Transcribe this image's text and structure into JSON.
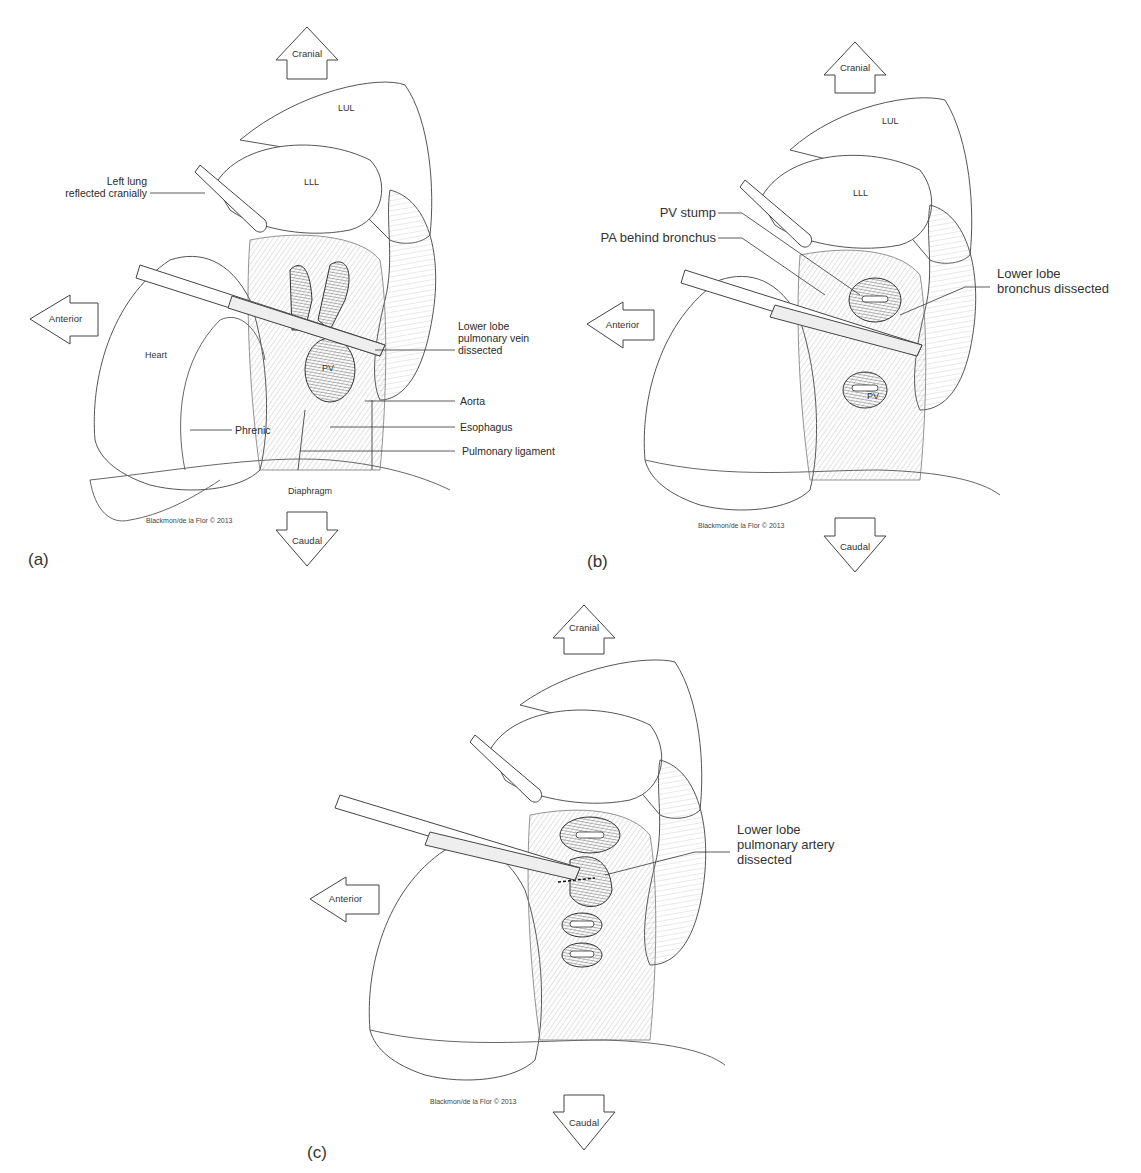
{
  "figure": {
    "credit": "Blackmon/de la Flor © 2013",
    "orientation": {
      "cranial": "Cranial",
      "caudal": "Caudal",
      "anterior": "Anterior"
    },
    "panels": [
      {
        "letter": "(a)",
        "organs": {
          "lul": "LUL",
          "lll": "LLL",
          "heart": "Heart",
          "pv": "PV",
          "diaphragm": "Diaphragm"
        },
        "labels": {
          "left_lung_1": "Left lung",
          "left_lung_2": "reflected cranially",
          "lower_lobe_1": "Lower lobe",
          "lower_lobe_2": "pulmonary vein",
          "lower_lobe_3": "dissected",
          "aorta": "Aorta",
          "esophagus": "Esophagus",
          "pulmonary_ligament": "Pulmonary ligament",
          "phrenic": "Phrenic"
        }
      },
      {
        "letter": "(b)",
        "organs": {
          "lul": "LUL",
          "lll": "LLL",
          "pv": "PV"
        },
        "labels": {
          "pv_stump": "PV stump",
          "pa_behind": "PA behind bronchus",
          "bronchus_1": "Lower lobe",
          "bronchus_2": "bronchus dissected"
        }
      },
      {
        "letter": "(c)",
        "labels": {
          "artery_1": "Lower lobe",
          "artery_2": "pulmonary artery",
          "artery_3": "dissected"
        }
      }
    ]
  }
}
